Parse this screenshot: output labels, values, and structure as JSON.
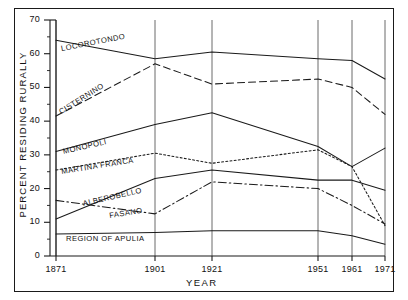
{
  "figure": {
    "y_axis_title": "PERCENT RESIDING RURALLY",
    "x_axis_title": "YEAR"
  },
  "axis": {
    "y_ticks": [
      "0",
      "10",
      "20",
      "30",
      "40",
      "50",
      "60",
      "70"
    ],
    "x_ticks": [
      "1871",
      "1901",
      "1921",
      "1951",
      "1961",
      "1971"
    ]
  },
  "chart_data": {
    "type": "line",
    "title": "",
    "subtitle": "",
    "xlabel": "YEAR",
    "ylabel": "PERCENT RESIDING RURALLY",
    "x": [
      1871,
      1901,
      1921,
      1951,
      1961,
      1971
    ],
    "xtick_labels": [
      "1871",
      "1901",
      "1921",
      "1951",
      "1961",
      "1971"
    ],
    "ytick_labels": [
      "0",
      "10",
      "20",
      "30",
      "40",
      "50",
      "60",
      "70"
    ],
    "xlim": [
      1871,
      1971
    ],
    "ylim": [
      0,
      70
    ],
    "grid": "vertical-only",
    "legend": "inline-labels",
    "series": [
      {
        "name": "LOCOROTONDO",
        "style": "solid",
        "values": [
          64.0,
          58.5,
          60.5,
          58.5,
          58.0,
          52.5
        ],
        "label_x": 62,
        "label_y": 44,
        "label_rotate": -11
      },
      {
        "name": "CISTERNINO",
        "style": "dashed",
        "values": [
          41.5,
          57.0,
          51.0,
          52.5,
          50.0,
          42.0
        ],
        "label_x": 62,
        "label_y": 107,
        "label_rotate": -32
      },
      {
        "name": "MONOPOLI",
        "style": "solid",
        "values": [
          31.0,
          39.0,
          42.5,
          32.5,
          26.5,
          32.0
        ],
        "label_x": 64,
        "label_y": 147,
        "label_rotate": -13
      },
      {
        "name": "MARTINA FRANCA",
        "style": "dotted",
        "values": [
          25.5,
          30.5,
          27.5,
          31.5,
          26.5,
          9.0
        ],
        "label_x": 62,
        "label_y": 167,
        "label_rotate": -9
      },
      {
        "name": "ALBEROBELLO",
        "style": "solid",
        "values": [
          11.0,
          23.0,
          25.5,
          22.5,
          22.5,
          19.5
        ],
        "label_x": 84,
        "label_y": 199,
        "label_rotate": -13
      },
      {
        "name": "FASANO",
        "style": "dash-dot",
        "values": [
          16.5,
          12.5,
          22.0,
          20.0,
          15.0,
          9.5
        ],
        "label_x": 110,
        "label_y": 211,
        "label_rotate": -9
      },
      {
        "name": "REGION OF APULIA",
        "style": "solid",
        "values": [
          6.5,
          7.0,
          7.5,
          7.5,
          6.0,
          3.5
        ],
        "label_x": 66,
        "label_y": 234,
        "label_rotate": 0
      }
    ]
  },
  "colors": {
    "ink": "#1a1a1a",
    "grid": "#5a5a5a",
    "background": "#ffffff"
  }
}
